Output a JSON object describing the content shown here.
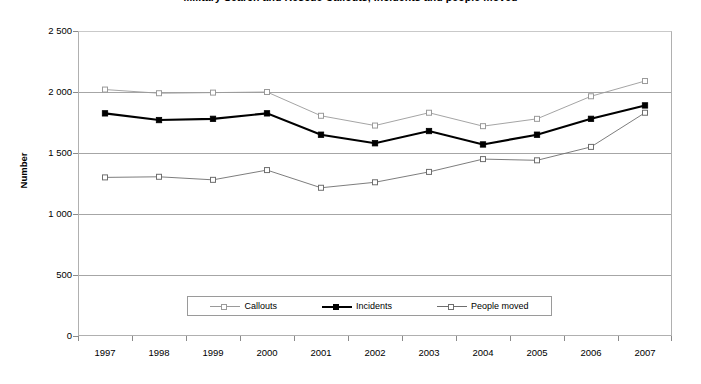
{
  "chart_data": {
    "type": "line",
    "title": "Military Search and Rescue Callouts, Incidents and people moved",
    "xlabel": "",
    "ylabel": "Number",
    "categories": [
      "1997",
      "1998",
      "1999",
      "2000",
      "2001",
      "2002",
      "2003",
      "2004",
      "2005",
      "2006",
      "2007"
    ],
    "ylim": [
      0,
      2500
    ],
    "ytick_step": 500,
    "ytick_labels": [
      "2 500",
      "2 000",
      "1 500",
      "1 000",
      "500",
      "0"
    ],
    "ytick_values": [
      2500,
      2000,
      1500,
      1000,
      500,
      0
    ],
    "grid": true,
    "legend_position": "bottom-center",
    "series": [
      {
        "name": "Callouts",
        "color": "#9a9a9a",
        "marker": "open-square",
        "values": [
          2020,
          1990,
          1995,
          2000,
          1805,
          1725,
          1830,
          1720,
          1780,
          1965,
          2090
        ]
      },
      {
        "name": "Incidents",
        "color": "#000000",
        "marker": "filled-square",
        "values": [
          1825,
          1770,
          1780,
          1825,
          1650,
          1580,
          1680,
          1570,
          1650,
          1780,
          1890
        ]
      },
      {
        "name": "People moved",
        "color": "#6e6e6e",
        "marker": "open-square",
        "values": [
          1300,
          1305,
          1280,
          1360,
          1215,
          1260,
          1345,
          1450,
          1440,
          1550,
          1830
        ]
      }
    ]
  },
  "legend": {
    "items": [
      {
        "label": "Callouts"
      },
      {
        "label": "Incidents"
      },
      {
        "label": "People moved"
      }
    ]
  }
}
